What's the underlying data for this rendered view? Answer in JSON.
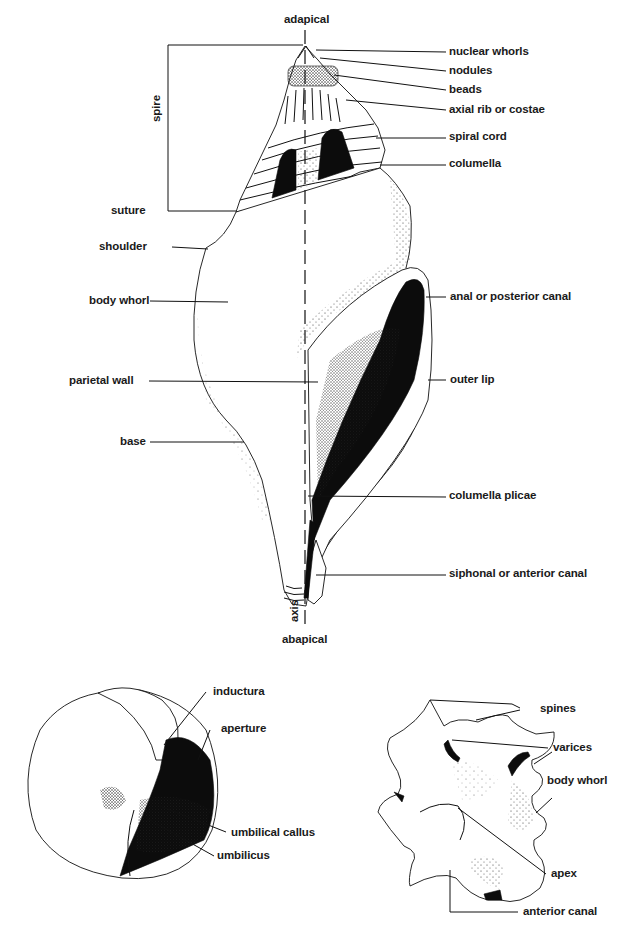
{
  "diagram": {
    "main_shell": {
      "top_label": "adapical",
      "bottom_label": "abapical",
      "axis_label": "axis",
      "spire_bracket_label": "spire",
      "right_labels": [
        "nuclear whorls",
        "nodules",
        "beads",
        "axial rib or costae",
        "spiral cord",
        "columella",
        "anal or posterior canal",
        "outer lip",
        "columella plicae",
        "siphonal or anterior canal"
      ],
      "left_labels": [
        "suture",
        "shoulder",
        "body whorl",
        "parietal wall",
        "base"
      ]
    },
    "umbilical_view": {
      "labels": [
        "inductura",
        "aperture",
        "umbilical callus",
        "umbilicus"
      ]
    },
    "spiny_shell_view": {
      "labels": [
        "spines",
        "varices",
        "body whorl",
        "apex",
        "anterior canal"
      ]
    },
    "colors": {
      "ink": "#111111",
      "background": "#ffffff"
    }
  }
}
